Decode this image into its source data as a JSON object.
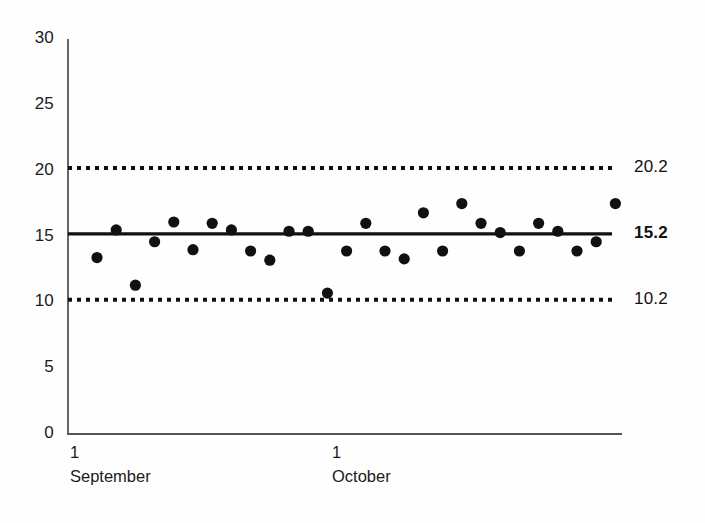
{
  "chart_data": {
    "type": "scatter",
    "title": "",
    "subtitle": "",
    "xlabel": "",
    "ylabel": "",
    "ylim": [
      0,
      30
    ],
    "grid": false,
    "legend_position": "none",
    "y_ticks": [
      "0",
      "5",
      "10",
      "15",
      "20",
      "25",
      "30"
    ],
    "y_tick_values": [
      0,
      5,
      10,
      15,
      20,
      25,
      30
    ],
    "x_ticks": [
      {
        "day": "1",
        "month": "September",
        "x_value": 0
      },
      {
        "day": "1",
        "month": "October",
        "x_value": 30
      }
    ],
    "reference_lines": [
      {
        "name": "upper-control-limit",
        "label": "20.2",
        "value": 20.2,
        "style": "dotted",
        "bold": false
      },
      {
        "name": "center-line",
        "label": "15.2",
        "value": 15.2,
        "style": "solid",
        "bold": true
      },
      {
        "name": "lower-control-limit",
        "label": "10.2",
        "value": 10.2,
        "style": "dotted",
        "bold": false
      }
    ],
    "series": [
      {
        "name": "observations",
        "marker": "filled-circle",
        "color": "#111111",
        "x": [
          1,
          2,
          3,
          4,
          5,
          6,
          7,
          8,
          9,
          10,
          11,
          12,
          13,
          14,
          15,
          16,
          17,
          18,
          19,
          20,
          21,
          22,
          23,
          24,
          25,
          26,
          27,
          28
        ],
        "values": [
          13.4,
          15.5,
          11.3,
          14.6,
          16.1,
          14.0,
          16.0,
          15.5,
          13.9,
          13.2,
          15.4,
          15.4,
          10.7,
          13.9,
          16.0,
          13.9,
          13.3,
          16.8,
          13.9,
          17.5,
          16.0,
          15.3,
          13.9,
          16.0,
          15.4,
          13.9,
          14.6,
          17.5
        ]
      }
    ]
  },
  "axes": {
    "y_axis_name": "y-axis",
    "x_axis_name": "x-axis"
  },
  "colors": {
    "line": "#111111",
    "marker": "#111111",
    "axis": "#4a4a4a",
    "background": "#fefefe"
  }
}
